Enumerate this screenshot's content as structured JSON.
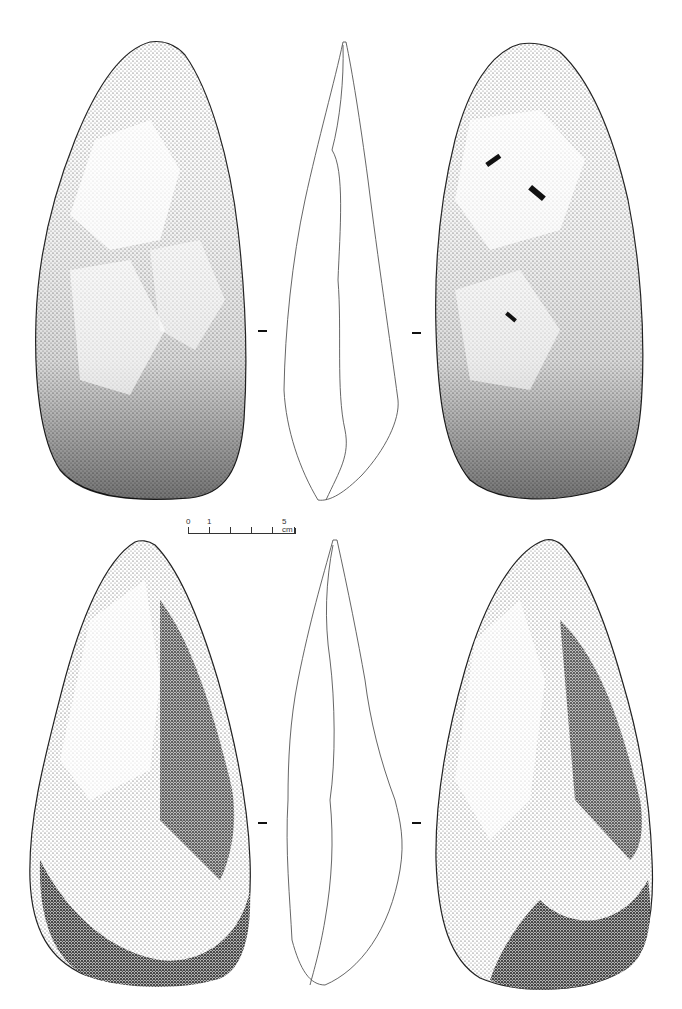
{
  "figure": {
    "scale_bar": {
      "labels": [
        "0",
        "1",
        "5 cm"
      ],
      "tick_count": 6
    },
    "rows": [
      {
        "name": "handaxe-1",
        "views": [
          "face-a",
          "profile",
          "face-b"
        ]
      },
      {
        "name": "handaxe-2",
        "views": [
          "face-a",
          "profile",
          "face-b"
        ]
      }
    ],
    "colors": {
      "ink": "#111111",
      "shade": "#555555",
      "paper": "#ffffff"
    }
  }
}
